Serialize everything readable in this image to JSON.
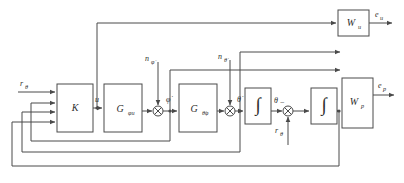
{
  "diagram": {
    "type": "control-block-diagram",
    "line_color": "#4a4a4a",
    "text_color": "#2e2e2e",
    "background": "#ffffff"
  },
  "blocks": [
    {
      "id": "K",
      "label": "K",
      "sub": "",
      "x": 57,
      "y": 84,
      "w": 36,
      "h": 48
    },
    {
      "id": "Gphiu",
      "label": "G",
      "sub": "φu",
      "x": 104,
      "y": 84,
      "w": 38,
      "h": 48
    },
    {
      "id": "Gthphi",
      "label": "G",
      "sub": "θ̇φ",
      "x": 179,
      "y": 84,
      "w": 38,
      "h": 48
    },
    {
      "id": "Int1",
      "label": "∫",
      "sub": "",
      "x": 245,
      "y": 88,
      "w": 26,
      "h": 36
    },
    {
      "id": "Int2",
      "label": "∫",
      "sub": "",
      "x": 311,
      "y": 88,
      "w": 26,
      "h": 36
    },
    {
      "id": "Wu",
      "label": "W",
      "sub": "u",
      "x": 338,
      "y": 10,
      "w": 31,
      "h": 26
    },
    {
      "id": "Wp",
      "label": "W",
      "sub": "p",
      "x": 342,
      "y": 78,
      "w": 31,
      "h": 50
    }
  ],
  "sums": [
    {
      "id": "sum-phidot",
      "cx": 158,
      "cy": 111,
      "r": 5
    },
    {
      "id": "sum-thetadot",
      "cx": 230,
      "cy": 111,
      "r": 5
    },
    {
      "id": "sum-theta",
      "cx": 288,
      "cy": 111,
      "r": 5
    }
  ],
  "signals": {
    "r_theta_in": "r",
    "r_theta_in_sub": "θ",
    "u": "u",
    "phi_dot": "φ̇",
    "theta_dot": "θ̇",
    "theta": "θ",
    "n_phi_dot": "n",
    "n_phi_dot_sub": "φ̇",
    "n_theta_dot": "n",
    "n_theta_dot_sub": "θ̇",
    "r_theta_fb": "r",
    "r_theta_fb_sub": "θ",
    "e_u": "e",
    "e_u_sub": "u",
    "e_p": "e",
    "e_p_sub": "p",
    "minus_sign": "−"
  },
  "block_labels": {
    "K": "K",
    "G_phiu_main": "G",
    "G_phiu_sub": "φu",
    "G_thetaphi_main": "G",
    "G_thetaphi_sub": "θ̇φ",
    "integrator": "∫",
    "W_u_main": "W",
    "W_u_sub": "u",
    "W_p_main": "W",
    "W_p_sub": "p"
  }
}
